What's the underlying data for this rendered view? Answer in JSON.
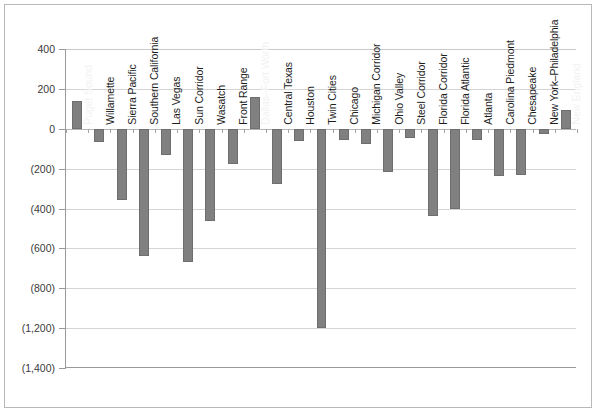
{
  "chart_data": {
    "type": "bar",
    "title": "",
    "subtitle": "",
    "xlabel": "",
    "ylabel": "",
    "ylim": [
      -1400,
      400
    ],
    "grid": true,
    "legend": false,
    "orientation": "vertical",
    "bar_color": "#808080",
    "categories": [
      "Puget Sound",
      "Willamette",
      "Sierra Pacific",
      "Southern California",
      "Las Vegas",
      "Sun Corridor",
      "Wasatch",
      "Front Range",
      "Dallas–Fort Worth",
      "Central Texas",
      "Houston",
      "Twin Cities",
      "Chicago",
      "Michigan Corridor",
      "Ohio Valley",
      "Steel Corridor",
      "Florida Corridor",
      "Florida Atlantic",
      "Atlanta",
      "Carolina Piedmont",
      "Chesapeake",
      "New York–Philadelphia",
      "New England"
    ],
    "values": [
      140,
      -65,
      -355,
      -640,
      -130,
      -670,
      -465,
      -175,
      160,
      -275,
      -60,
      -1200,
      -55,
      -75,
      -215,
      -45,
      -440,
      -400,
      -55,
      -235,
      -230,
      -25,
      95
    ],
    "yticks": [
      {
        "value": 400,
        "label": "400"
      },
      {
        "value": 200,
        "label": "200"
      },
      {
        "value": 0,
        "label": "0"
      },
      {
        "value": -200,
        "label": "(200)"
      },
      {
        "value": -400,
        "label": "(400)"
      },
      {
        "value": -600,
        "label": "(600)"
      },
      {
        "value": -800,
        "label": "(800)"
      },
      {
        "value": -1200,
        "label": "(1,200)"
      },
      {
        "value": -1400,
        "label": "(1,400)"
      }
    ]
  }
}
